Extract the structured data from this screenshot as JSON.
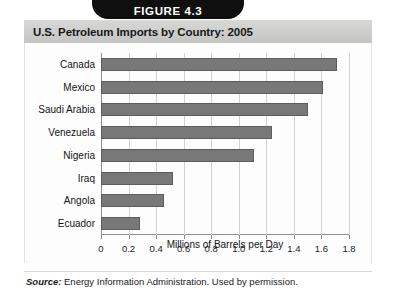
{
  "figure": {
    "tab_label": "FIGURE 4.3",
    "title": "U.S. Petroleum Imports by Country: 2005",
    "source_keyword": "Source:",
    "source_text": "Energy Information Administration. Used by permission."
  },
  "colors": {
    "tab_bg": "#100f0f",
    "title_bg": "#cdcdcb",
    "bar_fill": "#787878",
    "bar_border": "#5d5d5d",
    "axis": "#8d8d8d",
    "gridline": "#d2d2d2"
  },
  "chart_data": {
    "type": "bar",
    "orientation": "horizontal",
    "title": "U.S. Petroleum Imports by Country: 2005",
    "xlabel": "Millions of Barrels per Day",
    "ylabel": "",
    "xlim": [
      0,
      1.8
    ],
    "grid": true,
    "legend": false,
    "xticks": [
      "0",
      "0.2",
      "0.4",
      "0.6",
      "0.8",
      "1.0",
      "1.2",
      "1.4",
      "1.6",
      "1.8"
    ],
    "xtick_values": [
      0,
      0.2,
      0.4,
      0.6,
      0.8,
      1.0,
      1.2,
      1.4,
      1.6,
      1.8
    ],
    "categories": [
      "Canada",
      "Mexico",
      "Saudi Arabia",
      "Venezuela",
      "Nigeria",
      "Iraq",
      "Angola",
      "Ecuador"
    ],
    "values": [
      1.71,
      1.61,
      1.5,
      1.24,
      1.11,
      0.52,
      0.46,
      0.28
    ],
    "units": "millions of barrels per day",
    "source": "Energy Information Administration. Used by permission."
  }
}
